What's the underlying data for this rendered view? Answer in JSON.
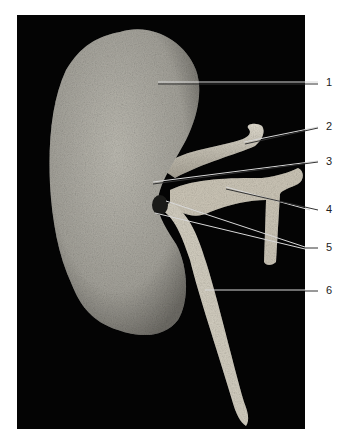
{
  "figure": {
    "background_color": "#040404",
    "tissue_color": "#b8b6ac",
    "labels": [
      {
        "id": "1",
        "text": "1",
        "y": 83
      },
      {
        "id": "2",
        "text": "2",
        "y": 127
      },
      {
        "id": "3",
        "text": "3",
        "y": 162
      },
      {
        "id": "4",
        "text": "4",
        "y": 210
      },
      {
        "id": "5",
        "text": "5",
        "y": 248
      },
      {
        "id": "6",
        "text": "6",
        "y": 291
      }
    ]
  }
}
